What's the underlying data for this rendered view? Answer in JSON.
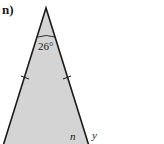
{
  "problem": {
    "part_label": "n)",
    "apex_angle_label": "26°",
    "interior_angle_var": "n",
    "exterior_angle_var": "y"
  },
  "colors": {
    "fill": "#d4d4d4",
    "stroke": "#1a1a1a"
  }
}
